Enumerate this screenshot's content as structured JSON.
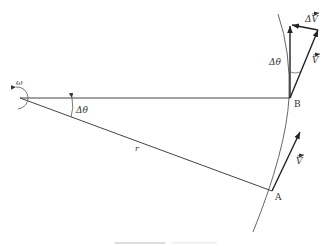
{
  "figure": {
    "colors": {
      "line": "#444444",
      "arc": "#555555",
      "text": "#333333",
      "bar": "#dddddd"
    }
  },
  "labels": {
    "omega": "ω",
    "delta_theta_center": "Δθ",
    "radius": "r",
    "point_a": "A",
    "point_b": "B",
    "delta_theta_b": "Δθ",
    "delta_v": "ΔV",
    "v_at_b": "V",
    "v_at_a": "V"
  },
  "geometry": {
    "center": [
      20,
      98
    ],
    "point_b": [
      290,
      98
    ],
    "point_a": [
      272,
      191
    ],
    "v_at_a_tip": [
      300,
      132
    ],
    "v_at_b_vertical_tip": [
      290,
      25
    ],
    "v_at_b_rotated_tip": [
      318,
      30
    ]
  }
}
